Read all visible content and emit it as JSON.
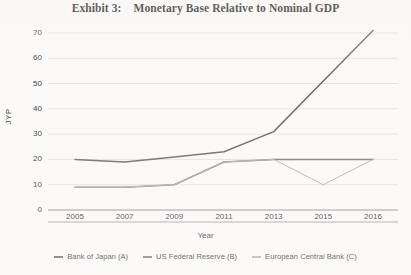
{
  "title": "Exhibit 3:    Monetary Base Relative to Nominal GDP",
  "axes": {
    "y_title": "JYP",
    "x_title": "Year",
    "y_ticks": [
      "70",
      "60",
      "50",
      "40",
      "30",
      "20",
      "10",
      "0"
    ],
    "x_ticks": [
      "2005",
      "2007",
      "2009",
      "2011",
      "2013",
      "2015",
      "2016"
    ]
  },
  "legend": [
    {
      "label": "Bank of Japan (A)",
      "color": "#6b6b6b"
    },
    {
      "label": "US Federal Reserve (B)",
      "color": "#7d7d7d"
    },
    {
      "label": "European Central Bank (C)",
      "color": "#b4b4b4"
    }
  ],
  "chart_data": {
    "type": "line",
    "title": "Exhibit 3:    Monetary Base Relative to Nominal GDP",
    "xlabel": "Year",
    "ylabel": "JYP",
    "categories": [
      "2005",
      "2007",
      "2009",
      "2011",
      "2013",
      "2015",
      "2016"
    ],
    "ylim": [
      0,
      70
    ],
    "ytick_step": 10,
    "grid": true,
    "legend_position": "bottom",
    "series": [
      {
        "name": "Bank of Japan (A)",
        "color": "#6b6b6b",
        "values": [
          20,
          19,
          21,
          23,
          31,
          51,
          71
        ]
      },
      {
        "name": "US Federal Reserve (B)",
        "color": "#7d7d7d",
        "values": [
          9,
          9,
          10,
          19,
          20,
          20,
          20
        ]
      },
      {
        "name": "European Central Bank (C)",
        "color": "#b4b4b4",
        "values": [
          9,
          9,
          10,
          19,
          20,
          10,
          20
        ]
      }
    ]
  }
}
